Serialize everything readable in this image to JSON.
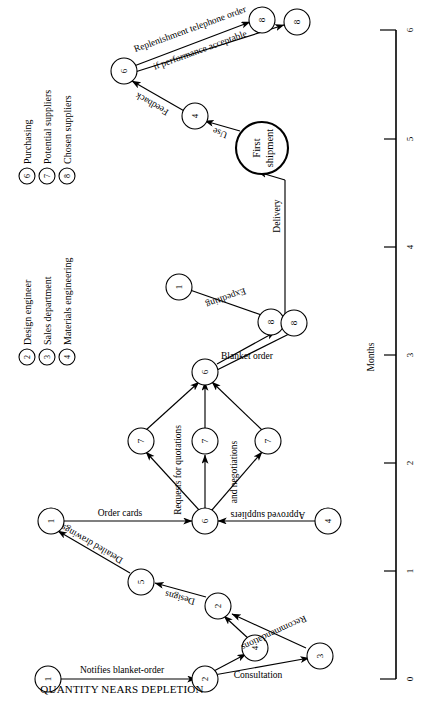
{
  "figure": {
    "orientation": "rotated-90",
    "caption_line": "QUANTITY NEARS DEPLETION",
    "axis": {
      "title": "Months",
      "ticks": [
        "0",
        "1",
        "2",
        "3",
        "4",
        "5",
        "6"
      ]
    }
  },
  "legend": {
    "items": [
      {
        "num": "2",
        "label": "Design engineer"
      },
      {
        "num": "3",
        "label": "Sales department"
      },
      {
        "num": "4",
        "label": "Materials engineering"
      },
      {
        "num": "6",
        "label": "Purchasing"
      },
      {
        "num": "7",
        "label": "Potential suppliers"
      },
      {
        "num": "8",
        "label": "Chosen suppliers"
      }
    ]
  },
  "nodes": [
    {
      "id": "n1a",
      "label": "1",
      "kind": "numbered"
    },
    {
      "id": "n2a",
      "label": "2",
      "kind": "numbered"
    },
    {
      "id": "n4a",
      "label": "4",
      "kind": "numbered"
    },
    {
      "id": "n3a",
      "label": "3",
      "kind": "numbered"
    },
    {
      "id": "n2b",
      "label": "2",
      "kind": "numbered"
    },
    {
      "id": "n5a",
      "label": "5",
      "kind": "numbered"
    },
    {
      "id": "n1b",
      "label": "1",
      "kind": "numbered"
    },
    {
      "id": "n6a",
      "label": "6",
      "kind": "numbered"
    },
    {
      "id": "n4b",
      "label": "4",
      "kind": "numbered"
    },
    {
      "id": "n7a",
      "label": "7",
      "kind": "numbered"
    },
    {
      "id": "n7b",
      "label": "7",
      "kind": "numbered"
    },
    {
      "id": "n7c",
      "label": "7",
      "kind": "numbered"
    },
    {
      "id": "n6b",
      "label": "6",
      "kind": "numbered"
    },
    {
      "id": "n8a",
      "label": "8",
      "kind": "numbered"
    },
    {
      "id": "n8b",
      "label": "8",
      "kind": "numbered"
    },
    {
      "id": "n1c",
      "label": "1",
      "kind": "numbered"
    },
    {
      "id": "nship",
      "label": "First shipment",
      "kind": "milestone"
    },
    {
      "id": "n4c",
      "label": "4",
      "kind": "numbered"
    },
    {
      "id": "n6c",
      "label": "6",
      "kind": "numbered"
    },
    {
      "id": "n8c",
      "label": "8",
      "kind": "numbered"
    },
    {
      "id": "n8d",
      "label": "8",
      "kind": "numbered"
    }
  ],
  "edge_labels": {
    "notifies": "Notifies blanket-order",
    "consultation": "Consultation",
    "recommendations": "Recommendations",
    "designs": "Designs",
    "detailed_drawings": "Detailed drawings",
    "order_cards": "Order cards",
    "approved_suppliers": "Approved suppliers",
    "requests_for_quotations": "Requests for quotations",
    "and_negotiations": "and negotiations",
    "blanket_order": "Blanket order",
    "expediting": "Expediting",
    "delivery": "Delivery",
    "use": "Use",
    "feedback": "Feedback",
    "replenishment": "Replenishment telephone order",
    "if_performance": "if performance acceptable"
  },
  "milestone_label": {
    "line1": "First",
    "line2": "shipment"
  },
  "colors": {
    "ink": "#000000",
    "paper": "#ffffff"
  }
}
